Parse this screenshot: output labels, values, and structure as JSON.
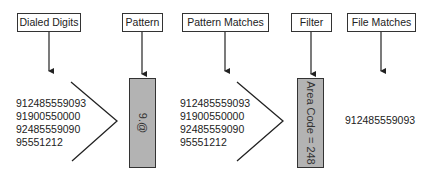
{
  "stages": [
    {
      "label": "Dialed Digits"
    },
    {
      "label": "Pattern"
    },
    {
      "label": "Pattern Matches"
    },
    {
      "label": "Filter"
    },
    {
      "label": "File Matches"
    }
  ],
  "dialed_digits": [
    "912485559093",
    "91900550000",
    "92485559090",
    "95551212"
  ],
  "pattern": {
    "value": "9.@"
  },
  "pattern_matches": [
    "912485559093",
    "91900550000",
    "92485559090",
    "95551212"
  ],
  "filter": {
    "value": "Area Code = 248"
  },
  "file_matches": [
    "912485559093"
  ],
  "colors": {
    "box_fill": "#b3b3b3",
    "stroke": "#333333",
    "background": "#ffffff"
  }
}
